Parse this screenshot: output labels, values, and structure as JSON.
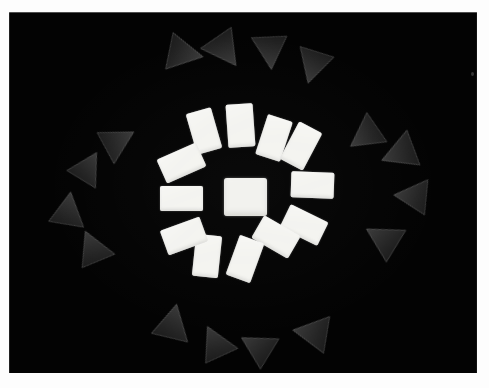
{
  "artwork": {
    "title": "Radial composition of white rectangles and dark triangles",
    "medium": "photographic print with white border",
    "background_color": "#030303",
    "border_color": "#fdfdfd",
    "rect_color": "#f3f3ef",
    "triangle_color": "#262626",
    "canvas": {
      "width": 489,
      "height": 388
    },
    "photo_area": {
      "left": 9,
      "top": 12,
      "width": 468,
      "height": 361
    }
  },
  "center": {
    "label": "center-square",
    "x": 224,
    "y": 178,
    "w": 43,
    "h": 38
  },
  "inner_ring": {
    "label": "inner ring of white rectangles",
    "count": 12,
    "items": [
      {
        "name": "rect-top-left-1",
        "x": 191,
        "y": 110,
        "w": 26,
        "h": 42,
        "rot": -16
      },
      {
        "name": "rect-top-1",
        "x": 227,
        "y": 104,
        "w": 27,
        "h": 43,
        "rot": -4
      },
      {
        "name": "rect-top-right-1",
        "x": 261,
        "y": 117,
        "w": 26,
        "h": 42,
        "rot": 18
      },
      {
        "name": "rect-top-right-2",
        "x": 288,
        "y": 125,
        "w": 26,
        "h": 42,
        "rot": 28
      },
      {
        "name": "rect-upper-left-2",
        "x": 160,
        "y": 150,
        "w": 43,
        "h": 26,
        "rot": -24
      },
      {
        "name": "rect-left-mid",
        "x": 160,
        "y": 186,
        "w": 43,
        "h": 25,
        "rot": 0
      },
      {
        "name": "rect-right-mid",
        "x": 291,
        "y": 172,
        "w": 43,
        "h": 26,
        "rot": 2
      },
      {
        "name": "rect-lower-right-1",
        "x": 283,
        "y": 212,
        "w": 42,
        "h": 26,
        "rot": 26
      },
      {
        "name": "rect-lower-right-2",
        "x": 255,
        "y": 224,
        "w": 42,
        "h": 26,
        "rot": 30
      },
      {
        "name": "rect-bottom-1",
        "x": 232,
        "y": 238,
        "w": 26,
        "h": 42,
        "rot": 20
      },
      {
        "name": "rect-bottom-2",
        "x": 194,
        "y": 235,
        "w": 26,
        "h": 42,
        "rot": 6
      },
      {
        "name": "rect-lower-left-1",
        "x": 163,
        "y": 223,
        "w": 42,
        "h": 26,
        "rot": -20
      }
    ]
  },
  "outer_ring": {
    "label": "outer ring of dark triangles",
    "count": 16,
    "items": [
      {
        "name": "triangle-top-1",
        "cx": 178,
        "cy": 51,
        "size": 42,
        "rot": 152
      },
      {
        "name": "triangle-top-2",
        "cx": 222,
        "cy": 44,
        "size": 42,
        "rot": 196
      },
      {
        "name": "triangle-top-3",
        "cx": 271,
        "cy": 45,
        "size": 40,
        "rot": 228
      },
      {
        "name": "triangle-top-4",
        "cx": 316,
        "cy": 60,
        "size": 40,
        "rot": 248
      },
      {
        "name": "triangle-left-1",
        "cx": 112,
        "cy": 143,
        "size": 40,
        "rot": 112
      },
      {
        "name": "triangle-left-2",
        "cx": 84,
        "cy": 172,
        "size": 38,
        "rot": 82
      },
      {
        "name": "triangle-left-3",
        "cx": 66,
        "cy": 216,
        "size": 40,
        "rot": 60
      },
      {
        "name": "triangle-left-4",
        "cx": 94,
        "cy": 254,
        "size": 40,
        "rot": 28
      },
      {
        "name": "triangle-right-1",
        "cx": 371,
        "cy": 133,
        "size": 40,
        "rot": 286
      },
      {
        "name": "triangle-right-2",
        "cx": 406,
        "cy": 152,
        "size": 42,
        "rot": 300
      },
      {
        "name": "triangle-right-3",
        "cx": 418,
        "cy": 198,
        "size": 40,
        "rot": 326
      },
      {
        "name": "triangle-right-4",
        "cx": 388,
        "cy": 243,
        "size": 42,
        "rot": 352
      },
      {
        "name": "triangle-bottom-1",
        "cx": 170,
        "cy": 329,
        "size": 42,
        "rot": 64
      },
      {
        "name": "triangle-bottom-2",
        "cx": 217,
        "cy": 349,
        "size": 40,
        "rot": 26
      },
      {
        "name": "triangle-bottom-3",
        "cx": 262,
        "cy": 351,
        "size": 40,
        "rot": 352
      },
      {
        "name": "triangle-bottom-4",
        "cx": 318,
        "cy": 335,
        "size": 42,
        "rot": 330
      }
    ]
  },
  "artifacts": [
    {
      "name": "dust-speck",
      "x": 471,
      "y": 72
    }
  ]
}
